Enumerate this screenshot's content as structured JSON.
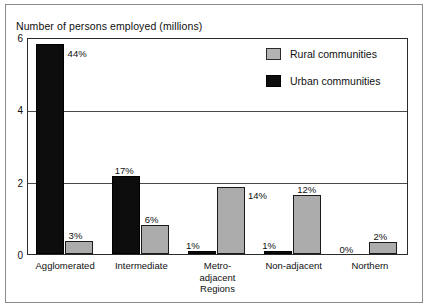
{
  "chart_data": {
    "type": "bar",
    "title": "Number of persons employed (millions)",
    "xlabel": "",
    "ylabel": "Number of persons employed (millions)",
    "ylim": [
      0,
      6
    ],
    "yticks": [
      0,
      2,
      4,
      6
    ],
    "ytick_labels": [
      "0",
      "2",
      "4",
      "6"
    ],
    "grid": true,
    "legend_position": "top-right",
    "categories": [
      "Agglomerated",
      "Intermediate",
      "Metro-\nadjacent\nRegions",
      "Non-adjacent",
      "Northern"
    ],
    "series": [
      {
        "name": "Urban communities",
        "color": "#0d0d0d",
        "values": [
          5.8,
          2.15,
          0.09,
          0.08,
          0.0
        ],
        "labels": [
          "44%",
          "17%",
          "1%",
          "1%",
          "0%"
        ]
      },
      {
        "name": "Rural communities",
        "color": "#acacac",
        "values": [
          0.36,
          0.8,
          1.86,
          1.62,
          0.33
        ],
        "labels": [
          "3%",
          "6%",
          "14%",
          "12%",
          "2%"
        ]
      }
    ]
  },
  "legend": {
    "items": [
      {
        "label": "Rural communities",
        "swatch": "rural"
      },
      {
        "label": "Urban communities",
        "swatch": "urban"
      }
    ]
  }
}
